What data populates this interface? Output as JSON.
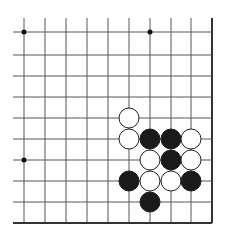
{
  "board": {
    "description": "Go board corner view (bottom-right corner), 10x10 visible intersections",
    "columns_visible": 10,
    "rows_visible": 10,
    "edges": [
      "right",
      "bottom"
    ],
    "star_points": [
      [
        0,
        0
      ],
      [
        6,
        0
      ],
      [
        0,
        6
      ]
    ],
    "stones": [
      {
        "color": "white",
        "col": 5,
        "row": 4
      },
      {
        "color": "white",
        "col": 5,
        "row": 5
      },
      {
        "color": "black",
        "col": 6,
        "row": 5
      },
      {
        "color": "black",
        "col": 7,
        "row": 5
      },
      {
        "color": "white",
        "col": 8,
        "row": 5
      },
      {
        "color": "white",
        "col": 6,
        "row": 6
      },
      {
        "color": "black",
        "col": 7,
        "row": 6
      },
      {
        "color": "white",
        "col": 8,
        "row": 6
      },
      {
        "color": "black",
        "col": 5,
        "row": 7
      },
      {
        "color": "white",
        "col": 6,
        "row": 7
      },
      {
        "color": "white",
        "col": 7,
        "row": 7
      },
      {
        "color": "black",
        "col": 8,
        "row": 7
      },
      {
        "color": "black",
        "col": 6,
        "row": 8
      }
    ],
    "colors": {
      "line": "#555555",
      "edge": "#333333",
      "black_stone": "#1a1a1a",
      "white_stone": "#ffffff",
      "white_stroke": "#222222"
    }
  }
}
